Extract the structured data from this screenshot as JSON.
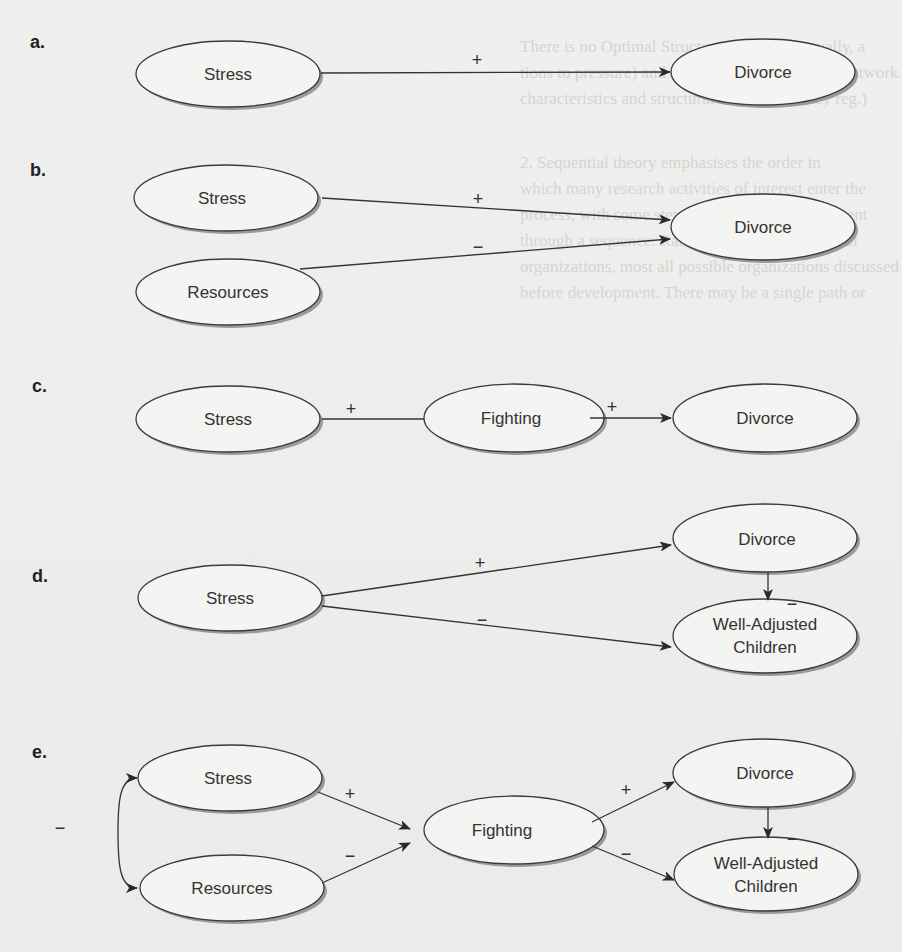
{
  "figure": {
    "panels": [
      {
        "label": "a.",
        "nodes": [
          {
            "id": "a-stress",
            "text": "Stress"
          },
          {
            "id": "a-divorce",
            "text": "Divorce"
          }
        ],
        "edges": [
          {
            "from": "Stress",
            "to": "Divorce",
            "sign": "+"
          }
        ]
      },
      {
        "label": "b.",
        "nodes": [
          {
            "id": "b-stress",
            "text": "Stress"
          },
          {
            "id": "b-resources",
            "text": "Resources"
          },
          {
            "id": "b-divorce",
            "text": "Divorce"
          }
        ],
        "edges": [
          {
            "from": "Stress",
            "to": "Divorce",
            "sign": "+"
          },
          {
            "from": "Resources",
            "to": "Divorce",
            "sign": "−"
          }
        ]
      },
      {
        "label": "c.",
        "nodes": [
          {
            "id": "c-stress",
            "text": "Stress"
          },
          {
            "id": "c-fighting",
            "text": "Fighting"
          },
          {
            "id": "c-divorce",
            "text": "Divorce"
          }
        ],
        "edges": [
          {
            "from": "Stress",
            "to": "Fighting",
            "sign": "+"
          },
          {
            "from": "Fighting",
            "to": "Divorce",
            "sign": "+"
          }
        ]
      },
      {
        "label": "d.",
        "nodes": [
          {
            "id": "d-stress",
            "text": "Stress"
          },
          {
            "id": "d-divorce",
            "text": "Divorce"
          },
          {
            "id": "d-wac",
            "text_line1": "Well-Adjusted",
            "text_line2": "Children"
          }
        ],
        "edges": [
          {
            "from": "Stress",
            "to": "Divorce",
            "sign": "+"
          },
          {
            "from": "Stress",
            "to": "Well-Adjusted Children",
            "sign": "−"
          },
          {
            "from": "Divorce",
            "to": "Well-Adjusted Children",
            "sign": "−"
          }
        ]
      },
      {
        "label": "e.",
        "nodes": [
          {
            "id": "e-stress",
            "text": "Stress"
          },
          {
            "id": "e-resources",
            "text": "Resources"
          },
          {
            "id": "e-fighting",
            "text": "Fighting"
          },
          {
            "id": "e-divorce",
            "text": "Divorce"
          },
          {
            "id": "e-wac",
            "text_line1": "Well-Adjusted",
            "text_line2": "Children"
          }
        ],
        "edges": [
          {
            "from": "Stress",
            "to": "Resources",
            "sign": "−",
            "type": "bidirectional-curve"
          },
          {
            "from": "Stress",
            "to": "Fighting",
            "sign": "+"
          },
          {
            "from": "Resources",
            "to": "Fighting",
            "sign": "−"
          },
          {
            "from": "Fighting",
            "to": "Divorce",
            "sign": "+"
          },
          {
            "from": "Fighting",
            "to": "Well-Adjusted Children",
            "sign": "−"
          },
          {
            "from": "Divorce",
            "to": "Well-Adjusted Children",
            "sign": "−"
          }
        ]
      }
    ],
    "signs": {
      "plus": "+",
      "minus": "−"
    }
  },
  "ghost_text": {
    "lines": [
      "There is no Optimal Structure. Because, actually, a",
      "tions to pressure) and Aldrich & Pfeffer (1976; network",
      "characteristics and structural interdependency reg.)",
      "2. Sequential theory emphasises the order in",
      "which many research activities of interest enter the",
      "process, with some steps more or less development",
      "through a sequence. Rather than a linear model of",
      "organizations, most all possible organizations discussed",
      "before development. There may be a single path or"
    ]
  }
}
